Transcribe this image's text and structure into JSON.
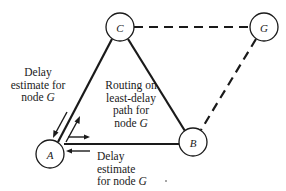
{
  "diagram": {
    "nodes": [
      {
        "id": "A",
        "label": "A"
      },
      {
        "id": "B",
        "label": "B"
      },
      {
        "id": "C",
        "label": "C"
      },
      {
        "id": "G",
        "label": "G"
      }
    ],
    "edges": [
      {
        "from": "A",
        "to": "C",
        "style": "solid"
      },
      {
        "from": "C",
        "to": "B",
        "style": "solid"
      },
      {
        "from": "A",
        "to": "B",
        "style": "solid"
      },
      {
        "from": "C",
        "to": "G",
        "style": "dashed"
      },
      {
        "from": "G",
        "to": "B",
        "style": "dashed"
      }
    ],
    "annotations": {
      "delay_left": {
        "line1": "Delay",
        "line2": "estimate for",
        "line3_prefix": "node ",
        "line3_node": "G"
      },
      "routing": {
        "line1": "Routing on",
        "line2": "least-delay",
        "line3": "path for",
        "line4_prefix": "node ",
        "line4_node": "G"
      },
      "delay_bottom": {
        "line1": "Delay",
        "line2": "estimate",
        "line3_prefix": "for node ",
        "line3_node": "G"
      }
    }
  }
}
